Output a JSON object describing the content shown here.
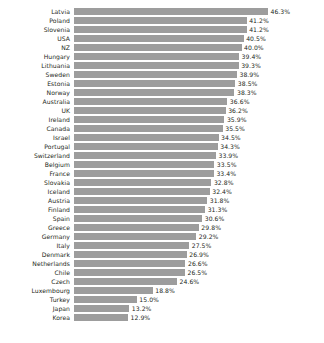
{
  "chart_data": {
    "type": "bar",
    "orientation": "horizontal",
    "title": "",
    "subtitle": "",
    "xlabel": "",
    "ylabel": "",
    "grid": false,
    "legend": null,
    "legend_position": "none",
    "value_suffix": "%",
    "bar_color": "#9d9d9d",
    "background_color": "#ffffff",
    "text_color": "#231f20",
    "xlim": [
      0,
      46.3
    ],
    "categories": [
      "Latvia",
      "Poland",
      "Slovenia",
      "USA",
      "NZ",
      "Hungary",
      "Lithuania",
      "Sweden",
      "Estonia",
      "Norway",
      "Australia",
      "UK",
      "Ireland",
      "Canada",
      "Israel",
      "Portugal",
      "Switzerland",
      "Belgium",
      "France",
      "Slovakia",
      "Iceland",
      "Austria",
      "Finland",
      "Spain",
      "Greece",
      "Germany",
      "Italy",
      "Denmark",
      "Netherlands",
      "Chile",
      "Czech",
      "Luxembourg",
      "Turkey",
      "Japan",
      "Korea"
    ],
    "values": [
      46.3,
      41.2,
      41.2,
      40.5,
      40.0,
      39.4,
      39.3,
      38.9,
      38.5,
      38.3,
      36.6,
      36.2,
      35.9,
      35.5,
      34.5,
      34.3,
      33.9,
      33.5,
      33.4,
      32.8,
      32.4,
      31.8,
      31.3,
      30.6,
      29.8,
      29.2,
      27.5,
      26.9,
      26.6,
      26.5,
      24.6,
      18.8,
      15.0,
      13.2,
      12.9
    ],
    "value_labels": [
      "46.3%",
      "41.2%",
      "41.2%",
      "40.5%",
      "40.0%",
      "39.4%",
      "39.3%",
      "38.9%",
      "38.5%",
      "38.3%",
      "36.6%",
      "36.2%",
      "35.9%",
      "35.5%",
      "34.5%",
      "34.3%",
      "33.9%",
      "33.5%",
      "33.4%",
      "32.8%",
      "32.4%",
      "31.8%",
      "31.3%",
      "30.6%",
      "29.8%",
      "29.2%",
      "27.5%",
      "26.9%",
      "26.6%",
      "26.5%",
      "24.6%",
      "18.8%",
      "15.0%",
      "13.2%",
      "12.9%"
    ]
  }
}
